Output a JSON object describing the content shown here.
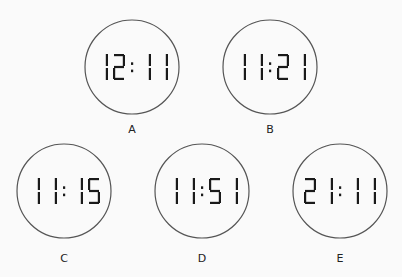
{
  "options": [
    {
      "letter": "A",
      "time": "12:11",
      "cx": 132,
      "cy": 67,
      "r": 47,
      "label_y": 133
    },
    {
      "letter": "B",
      "time": "11:21",
      "cx": 270,
      "cy": 67,
      "r": 47,
      "label_y": 133
    },
    {
      "letter": "C",
      "time": "11:15",
      "cx": 64,
      "cy": 191,
      "r": 47,
      "label_y": 262
    },
    {
      "letter": "D",
      "time": "11:51",
      "cx": 202,
      "cy": 191,
      "r": 47,
      "label_y": 262
    },
    {
      "letter": "E",
      "time": "21:11",
      "cx": 340,
      "cy": 191,
      "r": 47,
      "label_y": 262
    }
  ],
  "colors": {
    "stroke": "#555555",
    "segment": "#1a1a1a",
    "background": "#fafafa"
  }
}
